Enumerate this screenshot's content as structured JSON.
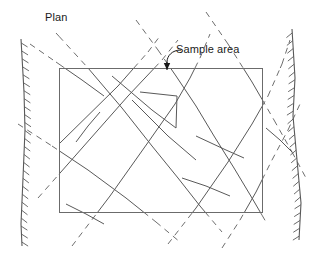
{
  "figure": {
    "title_label": "Plan",
    "annotation_label": "Sample area",
    "width": 317,
    "height": 254,
    "background_color": "#ffffff",
    "ink_color": "#595959",
    "text_color": "#1a1a1a",
    "rectangle_color": "#6b6b6b",
    "legend_note": {
      "solid_means": "trace mapped within sample area",
      "dashed_means": "trace projected outside sample area"
    }
  },
  "sample_area_rect": {
    "name": "sample-area-rectangle",
    "x": 59,
    "y": 68,
    "width": 203,
    "height": 144,
    "stroke": "#6b6b6b",
    "stroke_width": 1
  },
  "annotation_leader": {
    "name": "sample-area-leader",
    "path": "M 181 50 C 172 50 167 56 167 62 L 167 64",
    "arrow_tip_x": 167,
    "arrow_tip_y": 70,
    "arrow_half_width": 3.2,
    "arrow_length": 7
  },
  "boundaries": [
    {
      "name": "left-rock-boundary",
      "path": "M 21 39 L 24 92 L 25 130 L 23 178 L 21 224 L 22 246",
      "hatch_side": "left",
      "hatch_count": 26,
      "hatch_length": 7.5,
      "stroke_width": 1.1
    },
    {
      "name": "right-rock-boundary",
      "path": "M 292 29 L 295 78 L 293 116 L 297 160 L 301 203 L 299 240",
      "hatch_side": "right",
      "hatch_count": 27,
      "hatch_length": 7.5,
      "stroke_width": 1.1
    }
  ],
  "traces": [
    {
      "name": "trace-ne-1",
      "comment": "long NE-trending trace, lower-left to upper-right through rect top edge",
      "points": [
        [
          38,
          198
        ],
        [
          128,
          96
        ],
        [
          162,
          60
        ],
        [
          178,
          40
        ]
      ]
    },
    {
      "name": "trace-ne-2",
      "comment": "NE trace entering left edge rising to top-right area",
      "points": [
        [
          59,
          144
        ],
        [
          118,
          86
        ],
        [
          148,
          52
        ],
        [
          160,
          36
        ]
      ]
    },
    {
      "name": "trace-ne-3",
      "comment": "steep NE trace crossing rectangle mid-left",
      "points": [
        [
          72,
          246
        ],
        [
          110,
          196
        ],
        [
          149,
          141
        ],
        [
          175,
          104
        ],
        [
          190,
          78
        ],
        [
          200,
          58
        ],
        [
          210,
          34
        ]
      ]
    },
    {
      "name": "trace-ne-4",
      "comment": "NE trace on right side through rectangle",
      "points": [
        [
          168,
          244
        ],
        [
          196,
          208
        ],
        [
          228,
          162
        ],
        [
          252,
          124
        ],
        [
          268,
          96
        ],
        [
          282,
          64
        ],
        [
          290,
          40
        ]
      ]
    },
    {
      "name": "trace-ne-5",
      "comment": "short NE trace lower right outside",
      "points": [
        [
          222,
          248
        ],
        [
          240,
          220
        ],
        [
          256,
          192
        ],
        [
          272,
          160
        ],
        [
          288,
          130
        ],
        [
          300,
          104
        ]
      ]
    },
    {
      "name": "trace-se-1",
      "comment": "SE trace from upper-left area through rectangle down to bottom",
      "points": [
        [
          56,
          33
        ],
        [
          88,
          68
        ],
        [
          122,
          108
        ],
        [
          152,
          146
        ],
        [
          178,
          178
        ],
        [
          200,
          206
        ],
        [
          222,
          232
        ]
      ]
    },
    {
      "name": "trace-se-2",
      "comment": "SE trace crossing left boundary to rectangle interior",
      "points": [
        [
          18,
          124
        ],
        [
          52,
          146
        ],
        [
          88,
          170
        ],
        [
          126,
          198
        ],
        [
          156,
          222
        ],
        [
          180,
          242
        ]
      ]
    },
    {
      "name": "trace-se-3",
      "comment": "SE trace upper middle outside to rectangle top",
      "points": [
        [
          136,
          20
        ],
        [
          158,
          50
        ],
        [
          176,
          76
        ],
        [
          196,
          106
        ],
        [
          214,
          136
        ],
        [
          234,
          168
        ],
        [
          252,
          198
        ],
        [
          266,
          222
        ]
      ]
    },
    {
      "name": "trace-se-4",
      "comment": "SE trace from top right going down right across boundary",
      "points": [
        [
          206,
          12
        ],
        [
          228,
          44
        ],
        [
          252,
          82
        ],
        [
          274,
          120
        ],
        [
          292,
          152
        ],
        [
          306,
          178
        ]
      ]
    },
    {
      "name": "trace-se-5",
      "comment": "short SE trace top-left outside only",
      "points": [
        [
          30,
          44
        ],
        [
          56,
          62
        ],
        [
          82,
          80
        ],
        [
          104,
          96
        ]
      ]
    }
  ],
  "interior_segments": [
    {
      "name": "segment-zigzag-upper",
      "comment": "Z shape upper arm: from top edge near 120 down-right",
      "points": [
        [
          112,
          76
        ],
        [
          152,
          110
        ],
        [
          176,
          128
        ]
      ]
    },
    {
      "name": "segment-zigzag-mid",
      "comment": "Z shape middle: vertical-ish drop",
      "points": [
        [
          176,
          128
        ],
        [
          177,
          96
        ],
        [
          140,
          92
        ]
      ]
    },
    {
      "name": "segment-zigzag-lower",
      "comment": "Z shape lower arm angled down-right",
      "points": [
        [
          132,
          100
        ],
        [
          168,
          136
        ],
        [
          196,
          160
        ]
      ]
    },
    {
      "name": "segment-short-mid-left",
      "points": [
        [
          100,
          112
        ],
        [
          88,
          126
        ],
        [
          76,
          142
        ]
      ]
    },
    {
      "name": "segment-short-right-1",
      "points": [
        [
          196,
          136
        ],
        [
          226,
          150
        ],
        [
          244,
          158
        ]
      ]
    },
    {
      "name": "segment-short-right-2",
      "points": [
        [
          182,
          178
        ],
        [
          206,
          186
        ],
        [
          230,
          196
        ]
      ]
    },
    {
      "name": "segment-short-far-right",
      "points": [
        [
          266,
          128
        ],
        [
          280,
          140
        ],
        [
          292,
          152
        ]
      ]
    },
    {
      "name": "segment-short-bottom-left",
      "points": [
        [
          66,
          204
        ],
        [
          86,
          214
        ],
        [
          104,
          224
        ]
      ]
    }
  ]
}
